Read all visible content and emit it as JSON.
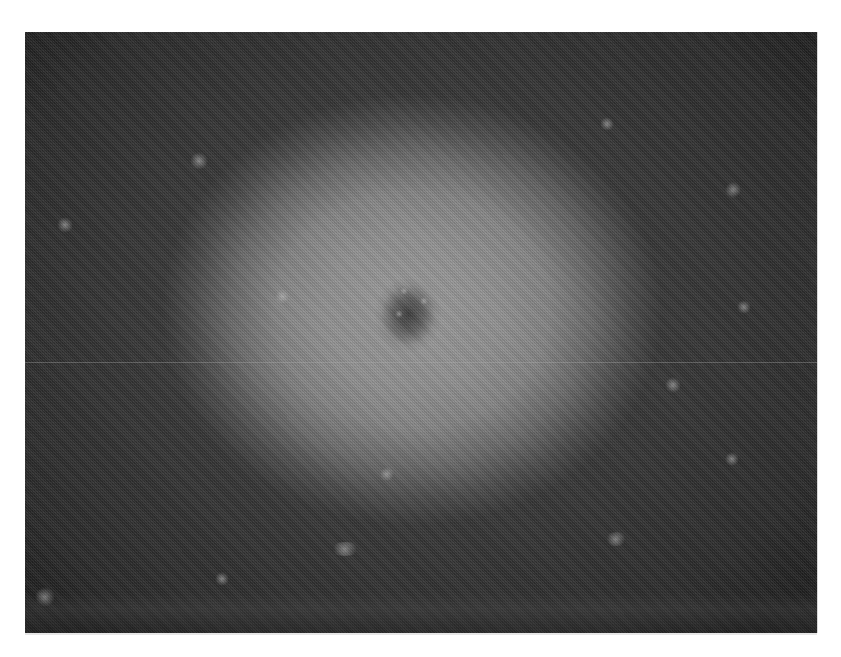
{
  "image": {
    "description": "Grayscale retinal / fundus-style image with bright circular region and dark central spot",
    "kind": "grayscale-photo",
    "frame": {
      "x": 25,
      "y": 32,
      "width": 792,
      "height": 601
    },
    "colors": {
      "background_page": "#ffffff",
      "dark_periphery": "#333333",
      "bright_region": "#9c9c9c",
      "central_spot": "#2d2d2d"
    },
    "features": {
      "bright_region_center": [
        412,
        310
      ],
      "central_dark_spot_center": [
        408,
        315
      ],
      "scanline_y": 362
    }
  }
}
